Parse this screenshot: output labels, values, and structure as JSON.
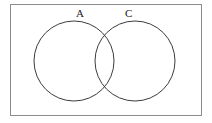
{
  "figure": {
    "kind": "venn-diagram",
    "caption": "",
    "universe_box": {
      "x": 10,
      "y": 4,
      "width": 192,
      "height": 112,
      "stroke_color": "#8c8c8c",
      "stroke_width": 1,
      "fill_color": "#ffffff"
    },
    "sets": [
      {
        "id": "set-a",
        "label": "A",
        "label_x": 80,
        "label_y": 13,
        "circle": {
          "cx": 74,
          "cy": 61,
          "r": 40,
          "stroke_color": "#3c3c3c",
          "stroke_width": 1,
          "fill": "none"
        }
      },
      {
        "id": "set-c",
        "label": "C",
        "label_x": 129,
        "label_y": 13,
        "circle": {
          "cx": 135,
          "cy": 61,
          "r": 40,
          "stroke_color": "#3c3c3c",
          "stroke_width": 1,
          "fill": "none"
        }
      }
    ],
    "intersection": {
      "shaded": false,
      "fill": "none"
    },
    "background_color": "#ffffff"
  }
}
